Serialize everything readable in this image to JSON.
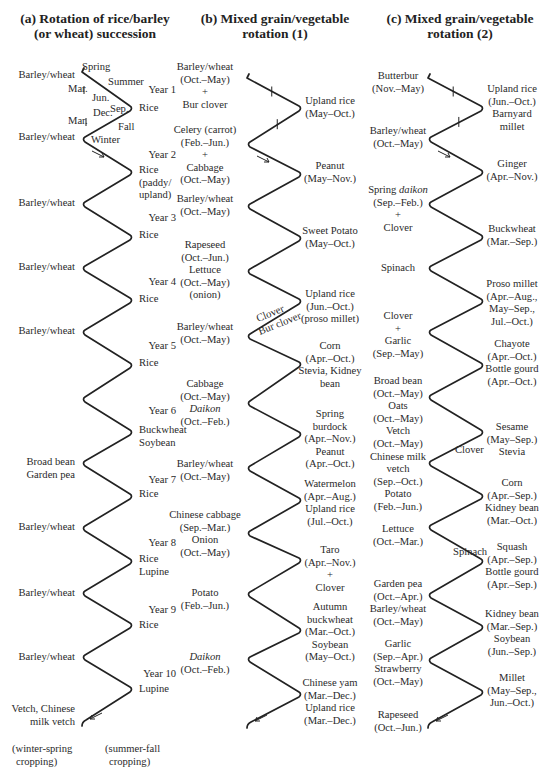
{
  "panels": [
    {
      "id": "a",
      "title_lines": [
        "(a) Rotation of rice/barley",
        "(or wheat) succession"
      ],
      "zigzag": {
        "left_x": 82,
        "right_x": 133,
        "left_y": [
          72,
          139,
          204,
          268,
          332,
          399,
          463,
          528,
          593,
          657,
          722
        ],
        "right_y": [
          108,
          172,
          237,
          300,
          365,
          432,
          496,
          561,
          625,
          689
        ]
      },
      "left_labels": [
        {
          "lines": [
            "Barley/wheat"
          ],
          "y": 78
        },
        {
          "lines": [
            "Barley/wheat"
          ],
          "y": 140
        },
        {
          "lines": [
            "Barley/wheat"
          ],
          "y": 206
        },
        {
          "lines": [
            "Barley/wheat"
          ],
          "y": 270
        },
        {
          "lines": [
            "Barley/wheat"
          ],
          "y": 334
        },
        {
          "lines": [
            "Broad bean",
            "Garden pea"
          ],
          "y": 465
        },
        {
          "lines": [
            "Barley/wheat"
          ],
          "y": 530
        },
        {
          "lines": [
            "Barley/wheat"
          ],
          "y": 596
        },
        {
          "lines": [
            "Barley/wheat"
          ],
          "y": 660
        },
        {
          "lines": [
            "Vetch, Chinese",
            "milk vetch"
          ],
          "y": 712
        }
      ],
      "right_labels": [
        {
          "lines": [
            "Rice"
          ],
          "y": 111
        },
        {
          "lines": [
            "Rice",
            "(paddy/",
            "upland)"
          ],
          "y": 173
        },
        {
          "lines": [
            "Rice"
          ],
          "y": 238
        },
        {
          "lines": [
            "Rice"
          ],
          "y": 302
        },
        {
          "lines": [
            "Rice"
          ],
          "y": 366
        },
        {
          "lines": [
            "Buckwheat",
            "Soybean"
          ],
          "y": 433
        },
        {
          "lines": [
            "Rice"
          ],
          "y": 497
        },
        {
          "lines": [
            "Rice",
            "Lupine"
          ],
          "y": 562
        },
        {
          "lines": [
            "Rice"
          ],
          "y": 628
        },
        {
          "lines": [
            "Lupine"
          ],
          "y": 692
        }
      ],
      "years": [
        {
          "label": "Year 1",
          "y": 93
        },
        {
          "label": "Year 2",
          "y": 158
        },
        {
          "label": "Year 3",
          "y": 221
        },
        {
          "label": "Year 4",
          "y": 285
        },
        {
          "label": "Year 5",
          "y": 349
        },
        {
          "label": "Year 6",
          "y": 414
        },
        {
          "label": "Year 7",
          "y": 483
        },
        {
          "label": "Year 8",
          "y": 546
        },
        {
          "label": "Year 9",
          "y": 613
        },
        {
          "label": "Year 10",
          "y": 677
        }
      ],
      "season_labels": [
        {
          "text": "Spring",
          "x": 82,
          "y": 70
        },
        {
          "text": "Summer",
          "x": 108,
          "y": 85
        },
        {
          "text": "Mar.",
          "x": 68,
          "y": 92
        },
        {
          "text": "Jun.",
          "x": 92,
          "y": 101
        },
        {
          "text": "Sep.",
          "x": 110,
          "y": 112
        },
        {
          "text": "Dec.",
          "x": 93,
          "y": 116
        },
        {
          "text": "Mar.",
          "x": 68,
          "y": 124
        },
        {
          "text": "Fall",
          "x": 118,
          "y": 130
        },
        {
          "text": "Winter",
          "x": 91,
          "y": 143
        }
      ],
      "footer": [
        {
          "lines": [
            "(winter-spring",
            "cropping)"
          ],
          "x": 12,
          "y": 752
        },
        {
          "lines": [
            "(summer-fall",
            "cropping)"
          ],
          "x": 105,
          "y": 752
        }
      ]
    },
    {
      "id": "b",
      "title_lines": [
        "(b) Mixed grain/vegetable",
        "rotation (1)"
      ],
      "zigzag": {
        "left_x": 247,
        "right_x": 302,
        "left_y": [
          78,
          144,
          206,
          271,
          336,
          403,
          468,
          533,
          594,
          659,
          724
        ],
        "right_y": [
          108,
          174,
          238,
          301,
          364,
          434,
          500,
          560,
          630,
          694
        ]
      },
      "left_labels": [
        {
          "lines": [
            "Barley/wheat",
            "(Oct.–May)",
            "+",
            "Bur clover"
          ],
          "y": 70
        },
        {
          "lines": [
            "Celery (carrot)",
            "(Feb.–Jun.)",
            "+",
            "Cabbage",
            "(Oct.–May)"
          ],
          "y": 133
        },
        {
          "lines": [
            "Barley/wheat",
            "(Oct.–May)"
          ],
          "y": 202
        },
        {
          "lines": [
            "Rapeseed",
            "(Oct.–Jun.)",
            "Lettuce",
            "(Oct.–May)",
            "(onion)"
          ],
          "y": 248
        },
        {
          "lines": [
            "Barley/wheat",
            "(Oct.–May)"
          ],
          "y": 330
        },
        {
          "lines": [
            "Cabbage",
            "(Oct.–May)",
            "Daikon|i",
            "(Oct.–Feb.)"
          ],
          "y": 387
        },
        {
          "lines": [
            "Barley/wheat",
            "(Oct.–May)"
          ],
          "y": 467
        },
        {
          "lines": [
            "Chinese cabbage",
            "(Sep.–Mar.)",
            "Onion",
            "(Oct.–May)"
          ],
          "y": 518
        },
        {
          "lines": [
            "Potato",
            "(Feb.–Jun.)"
          ],
          "y": 596
        },
        {
          "lines": [
            "Daikon|i",
            "(Oct.–Feb.)"
          ],
          "y": 660
        }
      ],
      "right_labels": [
        {
          "lines": [
            "Upland rice",
            "(May–Oct.)"
          ],
          "y": 104
        },
        {
          "lines": [
            "Peanut",
            "(May–Nov.)"
          ],
          "y": 169
        },
        {
          "lines": [
            "Sweet Potato",
            "(May–Oct.)"
          ],
          "y": 234
        },
        {
          "lines": [
            "Upland rice",
            "(Jun.–Oct.)",
            "(proso millet)"
          ],
          "y": 297
        },
        {
          "lines": [
            "Corn",
            "(Apr.–Oct.)",
            "Stevia, Kidney",
            "bean"
          ],
          "y": 349
        },
        {
          "lines": [
            "Spring",
            "burdock",
            "(Apr.–Nov.)",
            "Peanut",
            "(Apr.–Oct.)"
          ],
          "y": 417
        },
        {
          "lines": [
            "Watermelon",
            "(Apr.–Aug.)",
            "Upland rice",
            "(Jul.–Oct.)"
          ],
          "y": 487
        },
        {
          "lines": [
            "Taro",
            "(Apr.–Nov.)",
            "+",
            "Clover"
          ],
          "y": 553
        },
        {
          "lines": [
            "Autumn",
            "buckwheat",
            "(Mar.–Oct.)",
            "Soybean",
            "(May–Oct.)"
          ],
          "y": 610
        },
        {
          "lines": [
            "Chinese yam",
            "(Mar.–Dec.)",
            "Upland rice",
            "(Mar.–Dec.)"
          ],
          "y": 686
        }
      ],
      "cover_labels": [
        {
          "text": "Clover",
          "x": 258,
          "y": 322,
          "rotate": -22
        },
        {
          "text": "Bur clover",
          "x": 260,
          "y": 335,
          "rotate": -22
        }
      ]
    },
    {
      "id": "c",
      "title_lines": [
        "(c)   Mixed grain/vegetable",
        "rotation (2)"
      ],
      "zigzag": {
        "left_x": 428,
        "right_x": 484,
        "left_y": [
          78,
          139,
          204,
          268,
          332,
          397,
          463,
          527,
          595,
          660,
          724
        ],
        "right_y": [
          108,
          172,
          237,
          301,
          365,
          432,
          496,
          561,
          627,
          692
        ]
      },
      "left_labels": [
        {
          "lines": [
            "Butterbur",
            "(Nov.–May)"
          ],
          "y": 79
        },
        {
          "lines": [
            "Barley/wheat",
            "(Oct.–May)"
          ],
          "y": 134
        },
        {
          "lines": [
            "Spring daikon|ii",
            "(Sep.–Feb.)",
            "+",
            "Clover"
          ],
          "y": 193
        },
        {
          "lines": [
            "Spinach"
          ],
          "y": 271
        },
        {
          "lines": [
            "Clover",
            "+",
            "Garlic",
            "(Sep.–May)"
          ],
          "y": 319
        },
        {
          "lines": [
            "Broad bean",
            "(Oct.–May)",
            "Oats",
            "(Oct.–May)",
            "Vetch",
            "(Oct.–May)",
            "Chinese milk",
            "vetch",
            "(Sep.–Oct.)",
            "Potato",
            "(Feb.–Jun.)"
          ],
          "y": 384
        },
        {
          "lines": [
            "Lettuce",
            "(Oct.–Mar.)"
          ],
          "y": 532
        },
        {
          "lines": [
            "Garden pea",
            "(Oct.–Apr.)",
            "Barley/wheat",
            "(Oct.–May)"
          ],
          "y": 587
        },
        {
          "lines": [
            "Garlic",
            "(Sep.–Apr.)",
            "Strawberry",
            "(Oct.–May)"
          ],
          "y": 647
        },
        {
          "lines": [
            "Rapeseed",
            "(Oct.–Jun.)"
          ],
          "y": 718
        }
      ],
      "right_labels": [
        {
          "lines": [
            "Upland rice",
            "(Jun.–Oct.)",
            "Barnyard",
            "millet"
          ],
          "y": 92
        },
        {
          "lines": [
            "Ginger",
            "(Apr.–Nov.)"
          ],
          "y": 167
        },
        {
          "lines": [
            "Buckwheat",
            "(Mar.–Sep.)"
          ],
          "y": 232
        },
        {
          "lines": [
            "Proso millet",
            "(Apr.–Aug.,",
            "May–Sep.,",
            "Jul.–Oct.)"
          ],
          "y": 287
        },
        {
          "lines": [
            "Chayote",
            "(Apr.–Oct.)",
            "Bottle gourd",
            "(Apr.–Oct.)"
          ],
          "y": 347
        },
        {
          "lines": [
            "Sesame",
            "(May–Sep.)",
            "Stevia"
          ],
          "y": 430
        },
        {
          "lines": [
            "Corn",
            "(Apr.–Sep.)",
            "Kidney bean",
            "(Mar.–Oct.)"
          ],
          "y": 486
        },
        {
          "lines": [
            "Squash",
            "(Apr.–Sep.)",
            "Bottle gourd",
            "(Apr.–Sep.)"
          ],
          "y": 550
        },
        {
          "lines": [
            "Kidney bean",
            "(Mar.–Sep.)",
            "Soybean",
            "(Jun.–Sep.)"
          ],
          "y": 617
        },
        {
          "lines": [
            "Millet",
            "(May–Sep.,",
            "Jun.–Oct.)"
          ],
          "y": 681
        }
      ],
      "cover_labels": [
        {
          "text": "Clover",
          "x": 455,
          "y": 453,
          "rotate": 0
        },
        {
          "text": "Spinach",
          "x": 453,
          "y": 555,
          "rotate": 0
        }
      ]
    }
  ]
}
